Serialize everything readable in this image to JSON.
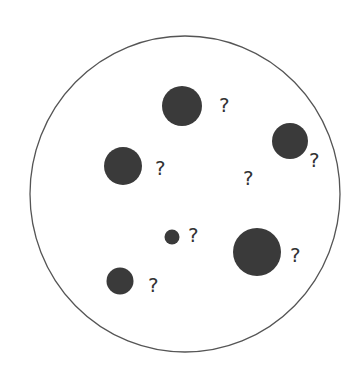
{
  "diagram": {
    "container": {
      "cx": 185,
      "cy": 194,
      "rx": 155,
      "ry": 158,
      "stroke": "#555555"
    },
    "blob_color": "#3a3a3a",
    "blobs": [
      {
        "cx": 182,
        "cy": 106,
        "r": 20
      },
      {
        "cx": 290,
        "cy": 141,
        "r": 18
      },
      {
        "cx": 123,
        "cy": 166,
        "r": 19
      },
      {
        "cx": 172,
        "cy": 237,
        "r": 7.5
      },
      {
        "cx": 257,
        "cy": 252,
        "r": 24
      },
      {
        "cx": 120,
        "cy": 281,
        "r": 13.5
      }
    ],
    "labels": [
      {
        "text": "?",
        "x": 219,
        "y": 112
      },
      {
        "text": "?",
        "x": 309,
        "y": 167
      },
      {
        "text": "?",
        "x": 155,
        "y": 175
      },
      {
        "text": "?",
        "x": 243,
        "y": 185
      },
      {
        "text": "?",
        "x": 188,
        "y": 242
      },
      {
        "text": "?",
        "x": 290,
        "y": 262
      },
      {
        "text": "?",
        "x": 148,
        "y": 292
      }
    ]
  }
}
